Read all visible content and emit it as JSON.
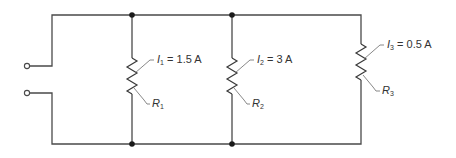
{
  "diagram": {
    "type": "parallel-circuit",
    "branches": [
      {
        "current_symbol": "I",
        "current_sub": "1",
        "current_value": "= 1.5 A",
        "resistor_symbol": "R",
        "resistor_sub": "1"
      },
      {
        "current_symbol": "I",
        "current_sub": "2",
        "current_value": "= 3 A",
        "resistor_symbol": "R",
        "resistor_sub": "2"
      },
      {
        "current_symbol": "I",
        "current_sub": "3",
        "current_value": "= 0.5 A",
        "resistor_symbol": "R",
        "resistor_sub": "3"
      }
    ],
    "terminals": 2,
    "junction_nodes": 4,
    "colors": {
      "wire": "#4a4a4a",
      "node": "#1a1a1a",
      "background": "#ffffff"
    }
  }
}
